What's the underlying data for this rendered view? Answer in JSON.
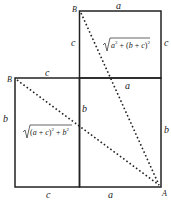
{
  "diagram": {
    "points": {
      "B_top": "B",
      "B_left": "B",
      "A": "A"
    },
    "edge_labels": {
      "top_a": "a",
      "top_square_left_c": "c",
      "top_square_right_c": "c",
      "left_rect_top_c": "c",
      "middle_a": "a",
      "left_rect_left_b": "b",
      "middle_b": "b",
      "right_b": "b",
      "bottom_c": "c",
      "bottom_a": "a"
    },
    "formulas": {
      "top_diagonal": "√(a² + (b + c)²)",
      "left_diagonal": "√((a + c)² + b²)"
    },
    "colors": {
      "line": "#222222",
      "background": "#ffffff"
    }
  }
}
